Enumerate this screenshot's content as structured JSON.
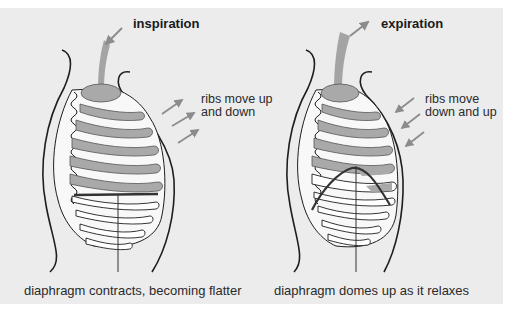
{
  "panels": [
    {
      "id": "inspiration",
      "title": "inspiration",
      "ribs_note_line1": "ribs move up",
      "ribs_note_line2": "and down",
      "caption": "diaphragm contracts, becoming flatter"
    },
    {
      "id": "expiration",
      "title": "expiration",
      "ribs_note_line1": "ribs move",
      "ribs_note_line2": "down and up",
      "caption": "diaphragm domes up as it relaxes"
    }
  ],
  "colors": {
    "background": "#ececec",
    "outline": "#1e1e1e",
    "lung_fill": "#a9a9a9",
    "rib_fill": "#ffffff",
    "arrow": "#8c8c8c",
    "diaphragm": "#333333"
  }
}
